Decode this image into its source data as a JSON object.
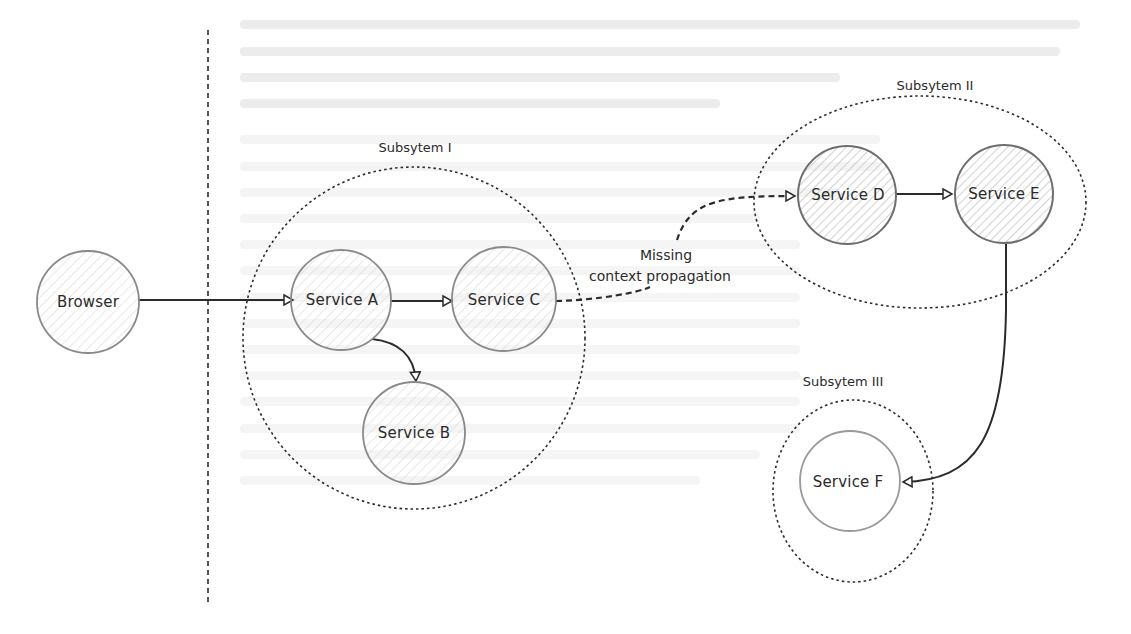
{
  "diagram": {
    "type": "distributed-tracing-architecture",
    "boundary": {
      "style": "dashed",
      "label": ""
    },
    "subsystems": [
      {
        "id": "sub1",
        "label": "Subsytem I",
        "members": [
          "svcA",
          "svcB",
          "svcC"
        ]
      },
      {
        "id": "sub2",
        "label": "Subsytem II",
        "members": [
          "svcD",
          "svcE"
        ]
      },
      {
        "id": "sub3",
        "label": "Subsytem III",
        "members": [
          "svcF"
        ]
      }
    ],
    "nodes": [
      {
        "id": "browser",
        "label": "Browser",
        "hatch": "light"
      },
      {
        "id": "svcA",
        "label": "Service A",
        "hatch": "light"
      },
      {
        "id": "svcC",
        "label": "Service C",
        "hatch": "light"
      },
      {
        "id": "svcB",
        "label": "Service B",
        "hatch": "light"
      },
      {
        "id": "svcD",
        "label": "Service D",
        "hatch": "dark"
      },
      {
        "id": "svcE",
        "label": "Service E",
        "hatch": "dark"
      },
      {
        "id": "svcF",
        "label": "Service F",
        "hatch": "none"
      }
    ],
    "edges": [
      {
        "from": "browser",
        "to": "svcA",
        "style": "solid"
      },
      {
        "from": "svcA",
        "to": "svcC",
        "style": "solid"
      },
      {
        "from": "svcA",
        "to": "svcB",
        "style": "solid"
      },
      {
        "from": "svcC",
        "to": "svcD",
        "style": "dashed",
        "label": "Missing context propagation"
      },
      {
        "from": "svcD",
        "to": "svcE",
        "style": "solid"
      },
      {
        "from": "svcE",
        "to": "svcF",
        "style": "solid"
      }
    ],
    "annotation": {
      "line1": "Missing",
      "line2": "context propagation"
    }
  },
  "colors": {
    "stroke": "#2b2b2b",
    "node_stroke": "#8a8a8a",
    "hatch_light": "#d6d6d6",
    "hatch_dark": "#a9a9a9",
    "background": "#ffffff"
  }
}
